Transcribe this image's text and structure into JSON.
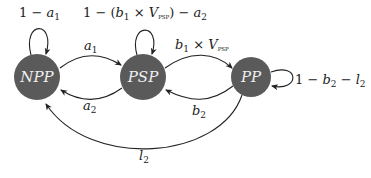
{
  "diagram": {
    "type": "state-transition",
    "nodes": [
      {
        "id": "NPP",
        "label": "NPP",
        "cx": 37,
        "cy": 77,
        "r": 23
      },
      {
        "id": "PSP",
        "label": "PSP",
        "cx": 143,
        "cy": 77,
        "r": 23
      },
      {
        "id": "PP",
        "label": "PP",
        "cx": 251,
        "cy": 77,
        "r": 20
      }
    ],
    "node_color": "#5a5a5a",
    "edges": [
      {
        "from": "NPP",
        "to": "NPP",
        "label": "1 − a1"
      },
      {
        "from": "NPP",
        "to": "PSP",
        "label": "a1"
      },
      {
        "from": "PSP",
        "to": "PSP",
        "label": "1 − (b1 × VPSP) − a2"
      },
      {
        "from": "PSP",
        "to": "PP",
        "label": "b1 × VPSP"
      },
      {
        "from": "PSP",
        "to": "NPP",
        "label": "a2"
      },
      {
        "from": "PP",
        "to": "PP",
        "label": "1 − b2 − l2"
      },
      {
        "from": "PP",
        "to": "PSP",
        "label": "b2"
      },
      {
        "from": "PP",
        "to": "NPP",
        "label": "l2"
      }
    ]
  }
}
